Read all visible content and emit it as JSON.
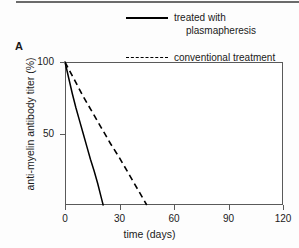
{
  "figure": {
    "panel_label": "A",
    "legend": {
      "entries": [
        {
          "label_line1": "treated with",
          "label_line2": "plasmapheresis",
          "style": "solid",
          "color": "#000000"
        },
        {
          "label_line1": "conventional treatment",
          "label_line2": "",
          "style": "dashed",
          "color": "#000000"
        }
      ]
    }
  },
  "chart_data": {
    "type": "line",
    "title": "",
    "subtitle": "",
    "xlabel": "time (days)",
    "ylabel": "anti-myelin antibody titer (%)",
    "xlim": [
      0,
      120
    ],
    "ylim": [
      0,
      100
    ],
    "xticks": [
      0,
      30,
      60,
      90,
      120
    ],
    "xtick_labels": [
      "0",
      "30",
      "60",
      "90",
      "120"
    ],
    "yticks": [
      50,
      100
    ],
    "ytick_labels": [
      "50",
      "100"
    ],
    "grid": false,
    "legend_position": "top-right",
    "series": [
      {
        "name": "treated with plasmapheresis",
        "style": "solid",
        "color": "#000000",
        "x": [
          0,
          2,
          4,
          6,
          8,
          10,
          12,
          14,
          16,
          18,
          20,
          21
        ],
        "values": [
          100,
          89,
          78,
          68,
          59,
          50,
          41,
          32,
          24,
          15,
          5,
          0
        ]
      },
      {
        "name": "conventional treatment",
        "style": "dashed",
        "color": "#000000",
        "x": [
          0,
          5,
          10,
          15,
          20,
          25,
          30,
          35,
          40,
          45
        ],
        "values": [
          100,
          88,
          76,
          65,
          54,
          43,
          33,
          22,
          11,
          0
        ]
      }
    ],
    "annotations": []
  }
}
